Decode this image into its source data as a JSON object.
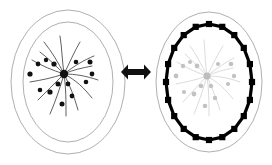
{
  "figure": {
    "background_color": "#ffffff",
    "width": 272,
    "height": 165,
    "panels": [
      {
        "id": "left-panel",
        "name": "cell-before",
        "caption": "",
        "cell": {
          "outer_ellipse": {
            "cx": 68,
            "cy": 82,
            "rx": 57,
            "ry": 72,
            "stroke": "#9a9a9a",
            "stroke_width": 0.8
          },
          "inner_ellipse": {
            "cx": 68,
            "cy": 82,
            "rx": 45,
            "ry": 60,
            "stroke": "#9a9a9a",
            "stroke_width": 0.8
          }
        },
        "aster": {
          "state": "condensed-dark",
          "hub": {
            "cx": 64,
            "cy": 74,
            "r": 4.2,
            "color": "#111111"
          },
          "filament_color": "#2b2b2b",
          "granule_color": "#111111",
          "filaments": [
            "M64,74 C58,62 52,52 44,42",
            "M64,74 C62,60 62,48 60,36",
            "M64,74 C70,62 74,52 80,42",
            "M64,74 C74,66 84,60 94,56",
            "M64,74 C76,74 86,76 98,80",
            "M64,74 C76,80 84,88 92,98",
            "M64,74 C70,86 74,96 78,110",
            "M64,74 C66,88 66,100 66,116",
            "M64,74 C60,88 56,100 50,114",
            "M64,74 C54,84 46,92 38,100",
            "M64,74 C52,78 42,80 30,82",
            "M64,74 C52,70 42,66 32,60",
            "M64,74 C56,66 48,58 40,52",
            "M64,74 C72,70 82,68 92,66"
          ],
          "granules": [
            {
              "cx": 38,
              "cy": 64,
              "r": 2.4
            },
            {
              "cx": 30,
              "cy": 74,
              "r": 2.6
            },
            {
              "cx": 46,
              "cy": 60,
              "r": 2.2
            },
            {
              "cx": 54,
              "cy": 64,
              "r": 2.6
            },
            {
              "cx": 76,
              "cy": 62,
              "r": 2.3
            },
            {
              "cx": 90,
              "cy": 62,
              "r": 2.5
            },
            {
              "cx": 92,
              "cy": 74,
              "r": 2.4
            },
            {
              "cx": 86,
              "cy": 82,
              "r": 2.3
            },
            {
              "cx": 68,
              "cy": 84,
              "r": 2.4
            },
            {
              "cx": 58,
              "cy": 84,
              "r": 2.5
            },
            {
              "cx": 50,
              "cy": 92,
              "r": 2.6
            },
            {
              "cx": 40,
              "cy": 90,
              "r": 2.3
            },
            {
              "cx": 72,
              "cy": 96,
              "r": 2.4
            },
            {
              "cx": 62,
              "cy": 104,
              "r": 2.5
            }
          ]
        }
      },
      {
        "id": "arrow",
        "name": "bidirectional-arrow",
        "direction": "both",
        "color": "#111111",
        "x": 121,
        "y": 64,
        "width": 30,
        "height": 16
      },
      {
        "id": "right-panel",
        "name": "cell-after",
        "caption": "",
        "cell": {
          "outer_ellipse": {
            "cx": 209,
            "cy": 82,
            "rx": 53,
            "ry": 70,
            "stroke": "#9a9a9a",
            "stroke_width": 0.8
          }
        },
        "cortex": {
          "state": "segmented-dark-ring",
          "cx": 209,
          "cy": 82,
          "rx": 43,
          "ry": 58,
          "stroke": "#000000",
          "stroke_width": 3.2,
          "node_color": "#000000",
          "node_count": 20,
          "node_size": 6.2
        },
        "aster": {
          "state": "faded-gray",
          "hub": {
            "cx": 207,
            "cy": 76,
            "r": 3.6,
            "color": "#bdbdbd"
          },
          "filament_color": "#cfcfcf",
          "granule_color": "#c2c2c2",
          "filaments": [
            "M207,76 C201,64 196,54 190,46",
            "M207,76 C205,62 205,50 204,40",
            "M207,76 C213,64 218,54 223,46",
            "M207,76 C217,68 226,62 234,58",
            "M207,76 C219,76 229,78 240,82",
            "M207,76 C218,82 226,90 233,99",
            "M207,76 C212,88 216,98 220,110",
            "M207,76 C209,90 209,102 209,116",
            "M207,76 C203,90 199,102 194,114",
            "M207,76 C198,86 190,94 183,102",
            "M207,76 C196,80 186,82 176,84",
            "M207,76 C196,72 186,68 177,62",
            "M207,76 C199,68 192,60 185,54",
            "M207,76 C215,72 224,70 233,68"
          ],
          "granules": [
            {
              "cx": 183,
              "cy": 66,
              "r": 2.2
            },
            {
              "cx": 176,
              "cy": 76,
              "r": 2.4
            },
            {
              "cx": 190,
              "cy": 62,
              "r": 2.0
            },
            {
              "cx": 197,
              "cy": 66,
              "r": 2.4
            },
            {
              "cx": 218,
              "cy": 64,
              "r": 2.1
            },
            {
              "cx": 231,
              "cy": 64,
              "r": 2.3
            },
            {
              "cx": 234,
              "cy": 76,
              "r": 2.2
            },
            {
              "cx": 228,
              "cy": 84,
              "r": 2.1
            },
            {
              "cx": 211,
              "cy": 86,
              "r": 2.2
            },
            {
              "cx": 201,
              "cy": 86,
              "r": 2.3
            },
            {
              "cx": 194,
              "cy": 94,
              "r": 2.4
            },
            {
              "cx": 184,
              "cy": 92,
              "r": 2.1
            },
            {
              "cx": 215,
              "cy": 98,
              "r": 2.2
            },
            {
              "cx": 205,
              "cy": 106,
              "r": 2.3
            }
          ]
        }
      }
    ]
  }
}
